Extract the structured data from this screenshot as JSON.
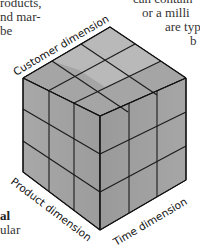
{
  "left_text": {
    "lines": [
      "roducts,",
      "nd mar-",
      "be"
    ]
  },
  "right_text": {
    "lines": [
      "can contain",
      "or a milli",
      "are typ",
      "b"
    ]
  },
  "bottom_left_text": {
    "bold_line": "al",
    "line": "ular"
  },
  "cube": {
    "grid": "3x3x3",
    "face_color": "#9a9a9a",
    "edge_color": "#1a1a1a",
    "labels": {
      "top": "Customer dimension",
      "left": "Product dimension",
      "right": "Time dimension"
    }
  }
}
